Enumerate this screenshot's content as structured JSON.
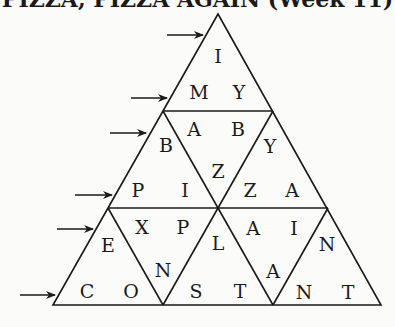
{
  "title": "PIZZA, PIZZA AGAIN (Week 11)",
  "puzzle": {
    "type": "triangle-word-puzzle",
    "rows": [
      {
        "row": 1,
        "letters": [
          "I"
        ]
      },
      {
        "row": 2,
        "letters": [
          "M",
          "Y"
        ]
      },
      {
        "row": 3,
        "letters": [
          "B",
          "A",
          "B",
          "Y"
        ]
      },
      {
        "row": 4,
        "letters": [
          "P",
          "I",
          "Z",
          "Z",
          "A"
        ]
      },
      {
        "row": 5,
        "letters": [
          "E",
          "X",
          "P",
          "L",
          "A",
          "I",
          "N"
        ]
      },
      {
        "row": 6,
        "letters": [
          "C",
          "O",
          "N",
          "S",
          "T",
          "A",
          "N",
          "T"
        ]
      }
    ],
    "cells": [
      {
        "ch": "I",
        "x": 218,
        "y": 56
      },
      {
        "ch": "M",
        "x": 199,
        "y": 92
      },
      {
        "ch": "Y",
        "x": 239,
        "y": 92
      },
      {
        "ch": "A",
        "x": 194,
        "y": 129
      },
      {
        "ch": "B",
        "x": 238,
        "y": 129
      },
      {
        "ch": "B",
        "x": 166,
        "y": 145
      },
      {
        "ch": "Y",
        "x": 270,
        "y": 146
      },
      {
        "ch": "Z",
        "x": 218,
        "y": 171
      },
      {
        "ch": "P",
        "x": 138,
        "y": 190
      },
      {
        "ch": "I",
        "x": 185,
        "y": 190
      },
      {
        "ch": "Z",
        "x": 250,
        "y": 190
      },
      {
        "ch": "A",
        "x": 292,
        "y": 190
      },
      {
        "ch": "X",
        "x": 142,
        "y": 227
      },
      {
        "ch": "P",
        "x": 183,
        "y": 227
      },
      {
        "ch": "A",
        "x": 253,
        "y": 228
      },
      {
        "ch": "I",
        "x": 294,
        "y": 228
      },
      {
        "ch": "E",
        "x": 108,
        "y": 245
      },
      {
        "ch": "L",
        "x": 218,
        "y": 243
      },
      {
        "ch": "N",
        "x": 327,
        "y": 244
      },
      {
        "ch": "N",
        "x": 163,
        "y": 270
      },
      {
        "ch": "A",
        "x": 273,
        "y": 271
      },
      {
        "ch": "C",
        "x": 87,
        "y": 291
      },
      {
        "ch": "O",
        "x": 131,
        "y": 291
      },
      {
        "ch": "S",
        "x": 196,
        "y": 291
      },
      {
        "ch": "T",
        "x": 240,
        "y": 291
      },
      {
        "ch": "N",
        "x": 304,
        "y": 292
      },
      {
        "ch": "T",
        "x": 348,
        "y": 292
      }
    ],
    "arrows": [
      {
        "x1": 167,
        "x2": 203,
        "y": 35
      },
      {
        "x1": 131,
        "x2": 167,
        "y": 98
      },
      {
        "x1": 110,
        "x2": 146,
        "y": 133
      },
      {
        "x1": 75,
        "x2": 112,
        "y": 195
      },
      {
        "x1": 57,
        "x2": 93,
        "y": 229
      },
      {
        "x1": 20,
        "x2": 55,
        "y": 295
      }
    ],
    "stroke_color": "#1a1a1a"
  }
}
